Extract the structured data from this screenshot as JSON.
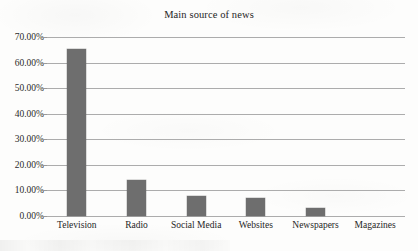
{
  "chart_data": {
    "type": "bar",
    "title": "Main source of news",
    "xlabel": "",
    "ylabel": "",
    "categories": [
      "Television",
      "Radio",
      "Social Media",
      "Websites",
      "Newspapers",
      "Magazines"
    ],
    "values": [
      65.3,
      14.0,
      8.0,
      7.0,
      3.0,
      0.0
    ],
    "value_labels": [
      "65.30%",
      "14.00%",
      "8.00%",
      "7.00%",
      "3.00%",
      "0.00%"
    ],
    "ylim": [
      0,
      70
    ],
    "ytick_values": [
      0,
      10,
      20,
      30,
      40,
      50,
      60,
      70
    ],
    "ytick_labels": [
      "0.00%",
      "10.00%",
      "20.00%",
      "30.00%",
      "40.00%",
      "50.00%",
      "60.00%",
      "70.00%"
    ],
    "grid": "horizontal",
    "legend": "none",
    "bar_color": "#6e6e6e",
    "gridline_color": "#acacac",
    "background_color": "#fdfdfc"
  }
}
